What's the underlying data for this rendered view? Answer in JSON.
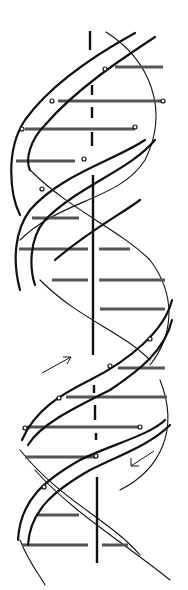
{
  "diagram": {
    "title": "DNA double helix",
    "colors": {
      "ink": "#111111",
      "rung": "#555555",
      "background": "#ffffff"
    },
    "elements": {
      "axis": "central-vertical-axis",
      "strand_a": "ribbon-strand-a",
      "strand_b": "ribbon-strand-b",
      "rungs": "base-pair-rungs",
      "arrow_up": "strand-direction-arrow-up",
      "arrow_down": "strand-direction-arrow-down"
    },
    "arrows": [
      {
        "direction": "up-right",
        "x1": 42,
        "y1": 373,
        "x2": 71,
        "y2": 357
      },
      {
        "direction": "down-left",
        "x1": 154,
        "y1": 451,
        "x2": 131,
        "y2": 466
      }
    ],
    "rung_count": 20
  }
}
